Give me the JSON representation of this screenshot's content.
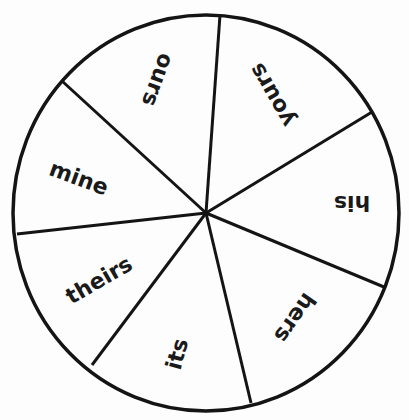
{
  "wheel": {
    "center": [
      206,
      213
    ],
    "rx": 193,
    "ry": 198,
    "stroke": "#141414",
    "spokes": [
      [
        220,
        15
      ],
      [
        372,
        112
      ],
      [
        384,
        287
      ],
      [
        251,
        403
      ],
      [
        92,
        365
      ],
      [
        17,
        234
      ],
      [
        62,
        81
      ]
    ],
    "segments": [
      {
        "label": "ours",
        "x": 158,
        "y": 80,
        "rot": 110
      },
      {
        "label": "yours",
        "x": 272,
        "y": 95,
        "rot": 240
      },
      {
        "label": "his",
        "x": 352,
        "y": 203,
        "rot": 180
      },
      {
        "label": "hers",
        "x": 295,
        "y": 318,
        "rot": 125
      },
      {
        "label": "its",
        "x": 177,
        "y": 354,
        "rot": -75
      },
      {
        "label": "theirs",
        "x": 99,
        "y": 280,
        "rot": -30
      },
      {
        "label": "mine",
        "x": 79,
        "y": 178,
        "rot": 20
      }
    ]
  }
}
